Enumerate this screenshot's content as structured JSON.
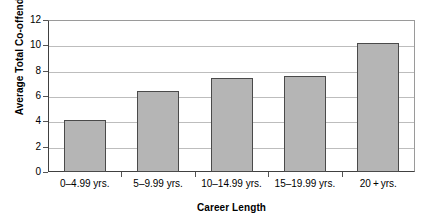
{
  "chart_data": {
    "type": "bar",
    "title": "",
    "xlabel": "Career Length",
    "ylabel": "Average Total Co-offenders",
    "categories": [
      "0–4.99 yrs.",
      "5–9.99 yrs.",
      "10–14.99 yrs.",
      "15–19.99 yrs.",
      "20 + yrs."
    ],
    "values": [
      4.1,
      6.4,
      7.45,
      7.55,
      10.2
    ],
    "ylim": [
      0,
      12
    ],
    "yticks": [
      0,
      2,
      4,
      6,
      8,
      10,
      12
    ],
    "ytick_labels": [
      "0",
      "2",
      "4",
      "6",
      "8",
      "10",
      "12"
    ],
    "grid": true,
    "legend": "none",
    "bar_color": "#b5b5b5",
    "bar_border_color": "#4a4a4a",
    "grid_color": "#bdbdbd",
    "axis_color": "#404040"
  }
}
